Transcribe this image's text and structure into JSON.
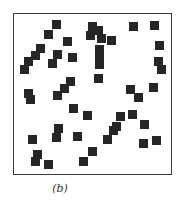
{
  "figure": {
    "caption": "(b)",
    "frame": {
      "x": 13,
      "y": 13,
      "width": 159,
      "height": 162
    },
    "square_size": 9,
    "square_color": "#262626",
    "squares": [
      [
        52,
        20
      ],
      [
        44,
        30
      ],
      [
        88,
        22
      ],
      [
        94,
        26
      ],
      [
        86,
        31
      ],
      [
        97,
        34
      ],
      [
        107,
        36
      ],
      [
        129,
        22
      ],
      [
        150,
        21
      ],
      [
        63,
        37
      ],
      [
        36,
        44
      ],
      [
        31,
        51
      ],
      [
        24,
        57
      ],
      [
        20,
        65
      ],
      [
        53,
        50
      ],
      [
        48,
        59
      ],
      [
        68,
        53
      ],
      [
        95,
        45
      ],
      [
        95,
        54
      ],
      [
        95,
        60
      ],
      [
        155,
        41
      ],
      [
        154,
        57
      ],
      [
        157,
        65
      ],
      [
        94,
        74
      ],
      [
        66,
        77
      ],
      [
        60,
        84
      ],
      [
        53,
        91
      ],
      [
        24,
        89
      ],
      [
        26,
        95
      ],
      [
        126,
        85
      ],
      [
        134,
        93
      ],
      [
        149,
        83
      ],
      [
        69,
        104
      ],
      [
        83,
        111
      ],
      [
        116,
        112
      ],
      [
        128,
        110
      ],
      [
        140,
        120
      ],
      [
        112,
        122
      ],
      [
        54,
        124
      ],
      [
        52,
        133
      ],
      [
        28,
        135
      ],
      [
        73,
        132
      ],
      [
        109,
        126
      ],
      [
        103,
        135
      ],
      [
        139,
        139
      ],
      [
        152,
        136
      ],
      [
        33,
        150
      ],
      [
        31,
        157
      ],
      [
        44,
        160
      ],
      [
        88,
        147
      ],
      [
        79,
        157
      ]
    ]
  }
}
